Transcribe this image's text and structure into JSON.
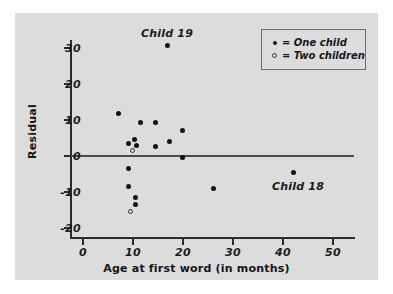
{
  "chart_data": {
    "type": "scatter",
    "title": "",
    "xlabel": "Age at first word (in months)",
    "ylabel": "Residual",
    "xlim": [
      0,
      55
    ],
    "ylim": [
      -22,
      34
    ],
    "xticks": [
      0,
      10,
      20,
      30,
      40,
      50
    ],
    "yticks": [
      -20,
      -10,
      0,
      10,
      20,
      30
    ],
    "xtick_labels": [
      "0",
      "10",
      "20",
      "30",
      "40",
      "50"
    ],
    "ytick_labels": [
      "-20",
      "-10",
      "0",
      "10",
      "20",
      "30"
    ],
    "grid": false,
    "zero_line": 0,
    "legend": {
      "position": "top-right",
      "entries": [
        {
          "marker": "filled-circle",
          "label": "= One child"
        },
        {
          "marker": "open-circle",
          "label": "= Two children"
        }
      ]
    },
    "series": [
      {
        "name": "One child",
        "marker": "filled-circle",
        "points": [
          {
            "x": 7,
            "y": 11.8
          },
          {
            "x": 9,
            "y": 3.5
          },
          {
            "x": 10.3,
            "y": 4.6
          },
          {
            "x": 10.6,
            "y": 3.0
          },
          {
            "x": 11.5,
            "y": 9.2
          },
          {
            "x": 14.5,
            "y": 9.2
          },
          {
            "x": 14.5,
            "y": 2.7
          },
          {
            "x": 17.3,
            "y": 4.0
          },
          {
            "x": 19.8,
            "y": 7.1
          },
          {
            "x": 19.8,
            "y": -0.3
          },
          {
            "x": 16.8,
            "y": 30.6
          },
          {
            "x": 9,
            "y": -3.4
          },
          {
            "x": 9,
            "y": -8.5
          },
          {
            "x": 10.4,
            "y": -11.4
          },
          {
            "x": 10.4,
            "y": -13.5
          },
          {
            "x": 26,
            "y": -9.0
          },
          {
            "x": 42,
            "y": -4.7
          }
        ]
      },
      {
        "name": "Two children",
        "marker": "open-circle",
        "points": [
          {
            "x": 9.9,
            "y": 1.6
          },
          {
            "x": 9.5,
            "y": -15.4
          }
        ]
      }
    ],
    "annotations": [
      {
        "text": "Child 19",
        "x": 16.8,
        "y": 34.3,
        "anchor": "center"
      },
      {
        "text": "Child 18",
        "x": 43.0,
        "y": -8.2,
        "anchor": "center"
      }
    ]
  }
}
